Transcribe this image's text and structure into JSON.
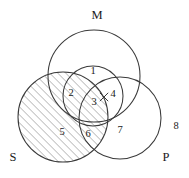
{
  "figure": {
    "type": "venn-diagram",
    "background_color": "#ffffff",
    "stroke_color": "#3a3a3a",
    "text_color": "#1a1a1a",
    "hatch_color": "#555555"
  },
  "sets": [
    {
      "id": "M",
      "label": "M",
      "cx": 94,
      "cy": 76,
      "r": 46,
      "shaded": false,
      "label_x": 97,
      "label_y": 16
    },
    {
      "id": "S",
      "label": "S",
      "cx": 63,
      "cy": 117,
      "r": 45,
      "shaded": true,
      "label_x": 13,
      "label_y": 158
    },
    {
      "id": "P",
      "label": "P",
      "cx": 120,
      "cy": 118,
      "r": 41,
      "shaded": false,
      "label_x": 166,
      "label_y": 158
    },
    {
      "id": "C",
      "label": "",
      "cx": 93,
      "cy": 96,
      "r": 30,
      "shaded": false,
      "label_x": 0,
      "label_y": 0
    }
  ],
  "regions": [
    {
      "id": "r1",
      "label": "1",
      "x": 93,
      "y": 72,
      "shaded": false
    },
    {
      "id": "r2",
      "label": "2",
      "x": 71,
      "y": 94,
      "shaded": false
    },
    {
      "id": "r3",
      "label": "3",
      "x": 94,
      "y": 103,
      "shaded": false
    },
    {
      "id": "r4",
      "label": "4",
      "x": 113,
      "y": 95,
      "shaded": false
    },
    {
      "id": "r5",
      "label": "5",
      "x": 62,
      "y": 133,
      "shaded": true
    },
    {
      "id": "r6",
      "label": "6",
      "x": 88,
      "y": 135,
      "shaded": true
    },
    {
      "id": "r7",
      "label": "7",
      "x": 120,
      "y": 131,
      "shaded": false
    },
    {
      "id": "r8",
      "label": "8",
      "x": 176,
      "y": 127,
      "shaded": false
    }
  ],
  "marks": [
    {
      "id": "x1",
      "label": "x",
      "x": 104,
      "y": 97,
      "meaning": "existential-x-marker"
    }
  ],
  "hatching": {
    "angle_deg": 45,
    "spacing_px": 4,
    "line_width_px": 0.7,
    "direction": "lower-left-to-upper-right"
  }
}
